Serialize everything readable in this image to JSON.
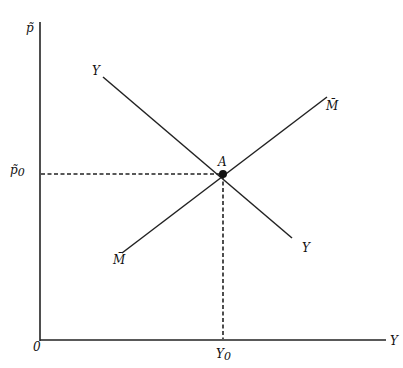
{
  "diagram": {
    "type": "IS-LM style equilibrium diagram",
    "axes": {
      "y_axis_label": "p̃",
      "x_axis_label": "Y",
      "origin_label": "0"
    },
    "curves": [
      {
        "name": "Y",
        "start_label": "Y",
        "end_label": "Y",
        "slope": "negative"
      },
      {
        "name": "M̄",
        "start_label": "M̄",
        "end_label": "M̄",
        "slope": "positive"
      }
    ],
    "equilibrium": {
      "point_label": "A",
      "price_label": "p̃",
      "price_subscript": "0",
      "output_label": "Y",
      "output_subscript": "0"
    },
    "colors": {
      "line": "#222222",
      "background": "#ffffff"
    }
  }
}
